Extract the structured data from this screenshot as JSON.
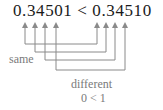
{
  "expression": "0.34501 < 0.34510",
  "left_number": "0.34501",
  "operator": "<",
  "right_number": "0.34510",
  "labels": {
    "same": "same",
    "different": "different",
    "comparison": "0 < 1"
  },
  "connections": [
    {
      "left_digit": "3",
      "right_digit": "3",
      "relation": "same"
    },
    {
      "left_digit": "4",
      "right_digit": "4",
      "relation": "same"
    },
    {
      "left_digit": "5",
      "right_digit": "5",
      "relation": "same"
    },
    {
      "left_digit": "0",
      "right_digit": "1",
      "relation": "different"
    }
  ],
  "colors": {
    "text": "#1a1a1a",
    "label": "#7a7a7a",
    "line": "#8a8a8a"
  }
}
